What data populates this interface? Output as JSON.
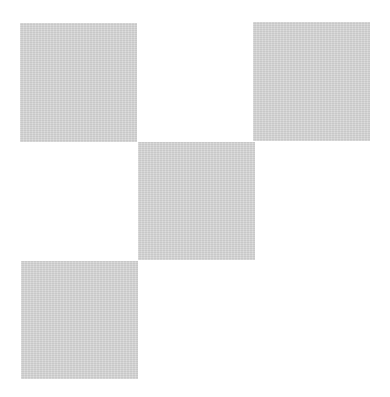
{
  "canvas": {
    "width": 390,
    "height": 397,
    "background": "#ffffff"
  },
  "squares": [
    {
      "name": "top-left",
      "x": 20,
      "y": 23,
      "w": 117,
      "h": 119,
      "color": "#d6d6d6"
    },
    {
      "name": "top-right",
      "x": 253,
      "y": 22,
      "w": 117,
      "h": 119,
      "color": "#d6d6d6"
    },
    {
      "name": "center",
      "x": 138,
      "y": 142,
      "w": 117,
      "h": 118,
      "color": "#d6d6d6"
    },
    {
      "name": "bottom-left",
      "x": 21,
      "y": 261,
      "w": 117,
      "h": 118,
      "color": "#d6d6d6"
    }
  ]
}
